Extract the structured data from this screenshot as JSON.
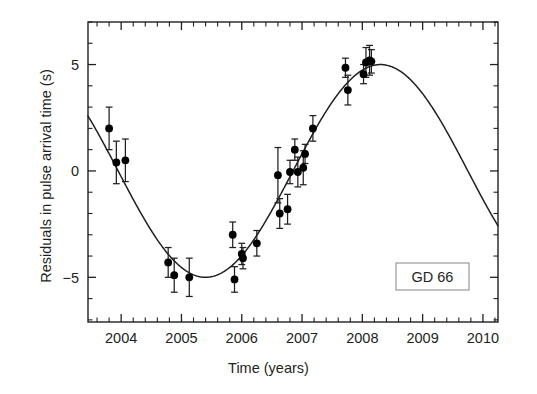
{
  "chart_data": {
    "type": "scatter",
    "title": "",
    "xlabel": "Time (years)",
    "ylabel": "Residuals in pulse arrival time (s)",
    "annotation": "GD 66",
    "xlim": [
      2003.45,
      2010.25
    ],
    "ylim": [
      -7.1,
      7.0
    ],
    "xticks": [
      2004,
      2005,
      2006,
      2007,
      2008,
      2009,
      2010
    ],
    "xtick_labels": [
      "2004",
      "2005",
      "2006",
      "2007",
      "2008",
      "2009",
      "2010"
    ],
    "x_minor_step": 0.2,
    "yticks": [
      -5,
      0,
      5
    ],
    "ytick_labels": [
      "−5",
      "0",
      "5"
    ],
    "y_minor_step": 1,
    "grid": false,
    "legend": false,
    "tick_direction": "in",
    "frame": "box",
    "marker": "filled-circle",
    "marker_color": "#000000",
    "errorbar_color": "#231f20",
    "curve_color": "#231f20",
    "series": [
      {
        "name": "Pulse arrival time residuals",
        "x": [
          2003.8,
          2003.92,
          2004.07,
          2004.78,
          2004.88,
          2005.13,
          2005.85,
          2005.88,
          2006.0,
          2006.02,
          2006.25,
          2006.6,
          2006.63,
          2006.76,
          2006.8,
          2006.88,
          2006.93,
          2007.02,
          2007.05,
          2007.18,
          2007.72,
          2007.76,
          2008.02,
          2008.06,
          2008.12,
          2008.15
        ],
        "y": [
          2.0,
          0.4,
          0.5,
          -4.3,
          -4.9,
          -5.0,
          -3.0,
          -5.1,
          -3.9,
          -4.1,
          -3.4,
          -0.2,
          -2.0,
          -1.8,
          -0.05,
          1.0,
          -0.05,
          0.15,
          0.8,
          2.0,
          4.85,
          3.8,
          4.55,
          5.1,
          5.2,
          5.15
        ],
        "yerr": [
          1.0,
          1.0,
          1.0,
          0.7,
          0.8,
          0.9,
          0.6,
          0.6,
          0.5,
          0.5,
          0.6,
          1.3,
          0.7,
          0.7,
          0.55,
          0.5,
          0.7,
          0.8,
          0.45,
          0.6,
          0.45,
          0.7,
          0.45,
          0.7,
          0.7,
          0.55
        ]
      }
    ],
    "fit_curve": {
      "name": "Sinusoidal fit",
      "description": "Sinusoid fit to light travel time delay",
      "amplitude": 5.0,
      "period_years": 5.8,
      "minimum": {
        "x": 2005.4,
        "y": -5.0
      },
      "maximum": {
        "x": 2008.3,
        "y": 5.0
      },
      "x_start": 2003.45,
      "x_end": 2010.25
    }
  }
}
